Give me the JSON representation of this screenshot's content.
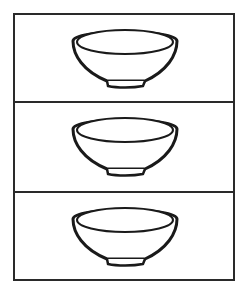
{
  "figure": {
    "panel_count": 3,
    "stroke_color": "#1a1a1a",
    "background": "#ffffff",
    "panels": [
      {
        "item": "bowl-icon"
      },
      {
        "item": "bowl-icon"
      },
      {
        "item": "bowl-icon"
      }
    ]
  }
}
